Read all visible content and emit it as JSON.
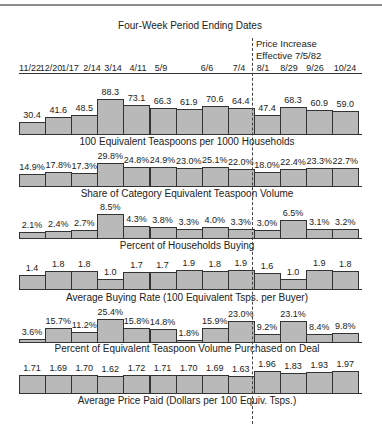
{
  "header": {
    "title": "Four-Week Period Ending Dates",
    "note_line1": "Price Increase",
    "note_line2": "Effective 7/5/82"
  },
  "dates": [
    "11/22",
    "12/20",
    "1/17",
    "2/14",
    "3/14",
    "4/11",
    "5/9",
    "6/6",
    "7/4",
    "8/1",
    "8/29",
    "9/26",
    "10/24"
  ],
  "date_positions": [
    30,
    51,
    70,
    92,
    113,
    138,
    161,
    207,
    239,
    263,
    289,
    315,
    345
  ],
  "chart_data": {
    "type": "bar",
    "title": "Four-Week Period Ending Dates",
    "annotation": "Price Increase Effective 7/5/82 (dashed divider between 7/4 and 8/1)",
    "categories": [
      "11/22",
      "12/20",
      "1/17",
      "2/14",
      "3/14",
      "4/11",
      "5/9",
      "6/6",
      "7/4",
      "8/1",
      "8/29",
      "9/26",
      "10/24"
    ],
    "panels": [
      {
        "name": "100 Equivalent Teaspoons per 1000 Households",
        "values": [
          30.4,
          41.6,
          48.5,
          88.3,
          73.1,
          66.3,
          61.9,
          70.6,
          64.4,
          47.4,
          68.3,
          60.9,
          59.0
        ],
        "labels": [
          "30.4",
          "41.6",
          "48.5",
          "88.3",
          "73.1",
          "66.3",
          "61.9",
          "70.6",
          "64.4",
          "47.4",
          "68.3",
          "60.9",
          "59.0"
        ],
        "baseline_y": 134,
        "px_per_unit": 0.398,
        "axis_min": 0,
        "title_y": 136
      },
      {
        "name": "Share of Category Equivalent Teaspoon Volume",
        "values": [
          14.9,
          17.8,
          17.3,
          29.8,
          24.8,
          24.9,
          23.0,
          25.1,
          22.0,
          18.0,
          22.4,
          23.3,
          22.7
        ],
        "labels": [
          "14.9%",
          "17.8%",
          "17.3%",
          "29.8%",
          "24.8%",
          "24.9%",
          "23.0%",
          "25.1%",
          "22.0%",
          "18.0%",
          "22.4%",
          "23.3%",
          "22.7%"
        ],
        "baseline_y": 186,
        "px_per_unit": 0.775,
        "axis_min": 0,
        "title_y": 188
      },
      {
        "name": "Percent of Households Buying",
        "values": [
          2.1,
          2.4,
          2.7,
          8.5,
          4.3,
          3.8,
          3.3,
          4.0,
          3.3,
          3.0,
          6.5,
          3.1,
          3.2
        ],
        "labels": [
          "2.1%",
          "2.4%",
          "2.7%",
          "8.5%",
          "4.3%",
          "3.8%",
          "3.3%",
          "4.0%",
          "3.3%",
          "3.0%",
          "6.5%",
          "3.1%",
          "3.2%"
        ],
        "baseline_y": 238,
        "px_per_unit": 2.8,
        "axis_min": 0,
        "title_y": 240
      },
      {
        "name": "Average Buying Rate (100 Equivalent Tsps. per Buyer)",
        "values": [
          1.4,
          1.8,
          1.8,
          1.0,
          1.7,
          1.7,
          1.9,
          1.8,
          1.9,
          1.6,
          1.0,
          1.9,
          1.8
        ],
        "labels": [
          "1.4",
          "1.8",
          "1.8",
          "1.0",
          "1.7",
          "1.7",
          "1.9",
          "1.8",
          "1.9",
          "1.6",
          "1.0",
          "1.9",
          "1.8"
        ],
        "baseline_y": 289,
        "px_per_unit": 10,
        "axis_min": 0,
        "title_y": 292
      },
      {
        "name": "Percent of Equivalent Teaspoon Volume Purchased on Deal",
        "values": [
          3.6,
          15.7,
          11.2,
          25.4,
          15.8,
          14.8,
          1.8,
          15.9,
          23.0,
          9.2,
          23.1,
          8.4,
          9.8
        ],
        "labels": [
          "3.6%",
          "15.7%",
          "11.2%",
          "25.4%",
          "15.8%",
          "14.8%",
          "1.8%",
          "15.9%",
          "23.0%",
          "9.2%",
          "23.1%",
          "8.4%",
          "9.8%"
        ],
        "baseline_y": 342,
        "px_per_unit": 0.9,
        "axis_min": 0,
        "title_y": 343
      },
      {
        "name": "Average Price Paid (Dollars per 100 Equiv. Tsps.)",
        "values": [
          1.71,
          1.69,
          1.7,
          1.62,
          1.72,
          1.71,
          1.7,
          1.69,
          1.63,
          1.96,
          1.83,
          1.93,
          1.97
        ],
        "labels": [
          "1.71",
          "1.69",
          "1.70",
          "1.62",
          "1.72",
          "1.71",
          "1.70",
          "1.69",
          "1.63",
          "1.96",
          "1.83",
          "1.93",
          "1.97"
        ],
        "baseline_y": 393,
        "px_per_unit": 14.3,
        "axis_min": 0.43,
        "title_y": 395
      }
    ],
    "bar_layout": {
      "x0": 19,
      "bar_width": 26.1
    },
    "colors": {
      "bar_fill": "#b9b9b9",
      "bar_edge": "#333333"
    },
    "grid": false,
    "legend": "none"
  }
}
